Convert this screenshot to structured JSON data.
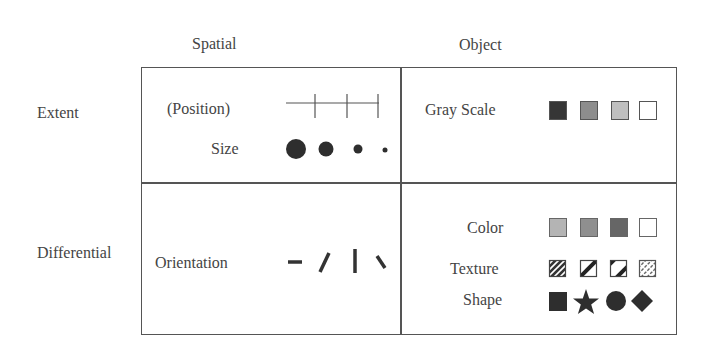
{
  "columns": {
    "spatial": "Spatial",
    "object": "Object"
  },
  "rows": {
    "extent": "Extent",
    "differential": "Differential"
  },
  "cells": {
    "extent_spatial": {
      "items": [
        {
          "label": "(Position)",
          "glyphs": "tick-marks-on-line"
        },
        {
          "label": "Size",
          "glyphs": [
            "circle-large",
            "circle-medium",
            "circle-small",
            "circle-tiny"
          ]
        }
      ]
    },
    "extent_object": {
      "items": [
        {
          "label": "Gray Scale",
          "glyphs": [
            "square-dark",
            "square-mid",
            "square-light",
            "square-white"
          ]
        }
      ]
    },
    "differential_spatial": {
      "items": [
        {
          "label": "Orientation",
          "glyphs": [
            "dash-horizontal",
            "dash-slant-right",
            "dash-vertical",
            "dash-slant-left"
          ]
        }
      ]
    },
    "differential_object": {
      "items": [
        {
          "label": "Color",
          "glyphs": [
            "square-light-gray",
            "square-mid-gray",
            "square-dark-gray",
            "square-white"
          ]
        },
        {
          "label": "Texture",
          "glyphs": [
            "hatch-dense",
            "hatch-single",
            "hatch-double",
            "hatch-fine"
          ]
        },
        {
          "label": "Shape",
          "glyphs": [
            "square",
            "star",
            "circle",
            "diamond"
          ]
        }
      ]
    }
  },
  "colors": {
    "ink": "#333333",
    "border": "#555555",
    "gray_dark": "#3a3a3a",
    "gray_mid": "#8c8c8c",
    "gray_light": "#bdbdbd",
    "white": "#ffffff",
    "color_light": "#b4b4b4",
    "color_mid": "#8e8e8e",
    "color_dark": "#666666"
  }
}
